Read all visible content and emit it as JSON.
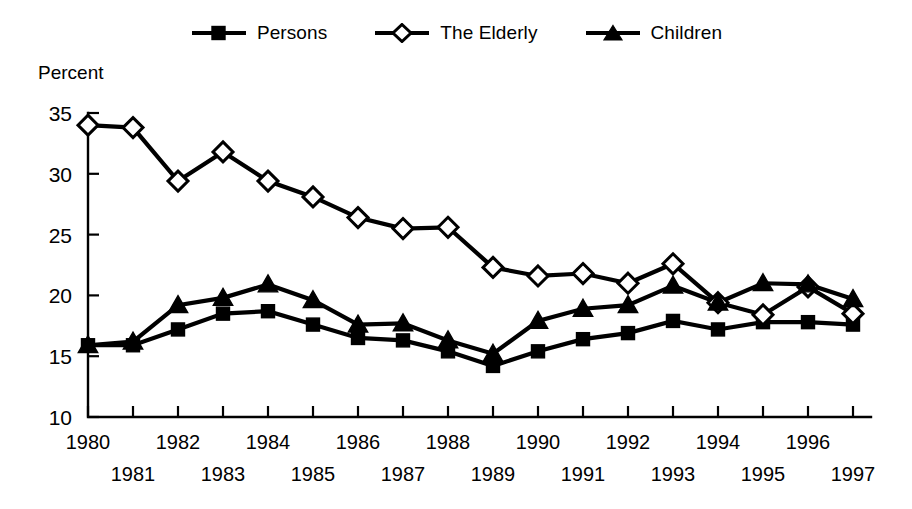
{
  "chart_data": {
    "type": "line",
    "title": "",
    "subtitle": "",
    "xlabel": "",
    "ylabel": "Percent",
    "ylim": [
      10,
      35
    ],
    "yticks": [
      10,
      15,
      20,
      25,
      30,
      35
    ],
    "grid": false,
    "legend_position": "top-center",
    "x": [
      1980,
      1981,
      1982,
      1983,
      1984,
      1985,
      1986,
      1987,
      1988,
      1989,
      1990,
      1991,
      1992,
      1993,
      1994,
      1995,
      1996,
      1997
    ],
    "categories": [
      "1980",
      "1981",
      "1982",
      "1983",
      "1984",
      "1985",
      "1986",
      "1987",
      "1988",
      "1989",
      "1990",
      "1991",
      "1992",
      "1993",
      "1994",
      "1995",
      "1996",
      "1997"
    ],
    "series": [
      {
        "name": "Persons",
        "marker": "filled-square",
        "color": "#000000",
        "values": [
          15.9,
          15.9,
          17.2,
          18.5,
          18.7,
          17.6,
          16.5,
          16.3,
          15.4,
          14.2,
          15.4,
          16.4,
          16.9,
          17.9,
          17.2,
          17.8,
          17.8,
          17.6
        ]
      },
      {
        "name": "The Elderly",
        "marker": "open-diamond",
        "color": "#000000",
        "values": [
          34.0,
          33.8,
          29.4,
          31.8,
          29.4,
          28.1,
          26.4,
          25.5,
          25.6,
          22.3,
          21.6,
          21.8,
          21.0,
          22.6,
          19.4,
          18.4,
          20.7,
          18.5
        ]
      },
      {
        "name": "Children",
        "marker": "filled-triangle",
        "color": "#000000",
        "values": [
          15.9,
          16.2,
          19.2,
          19.8,
          20.9,
          19.6,
          17.6,
          17.7,
          16.3,
          15.2,
          17.9,
          18.9,
          19.2,
          20.8,
          19.4,
          21.0,
          20.9,
          19.7
        ]
      }
    ]
  },
  "legend": {
    "items": [
      {
        "label": "Persons",
        "icon": "filled-square-marker-icon"
      },
      {
        "label": "The Elderly",
        "icon": "open-diamond-marker-icon"
      },
      {
        "label": "Children",
        "icon": "filled-triangle-marker-icon"
      }
    ]
  },
  "axes": {
    "y_title": "Percent",
    "y_tick_labels": [
      "10",
      "15",
      "20",
      "25",
      "30",
      "35"
    ],
    "x_tick_labels_top_row": [
      "1980",
      "1982",
      "1984",
      "1986",
      "1988",
      "1990",
      "1992",
      "1994",
      "1996"
    ],
    "x_tick_labels_bottom_row": [
      "1981",
      "1983",
      "1985",
      "1987",
      "1989",
      "1991",
      "1993",
      "1995",
      "1997"
    ]
  },
  "colors": {
    "background": "#ffffff",
    "ink": "#000000"
  }
}
